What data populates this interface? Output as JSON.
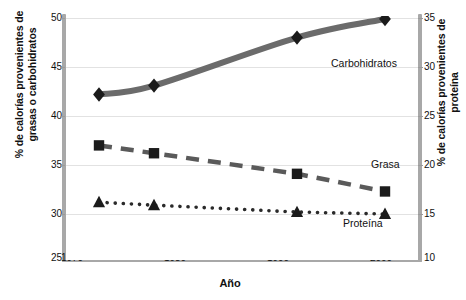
{
  "chart_data": {
    "type": "line",
    "title": "",
    "xlabel": "Año",
    "ylabel_left": "% de calorías provenientes de grasas o carbohidratos",
    "ylabel_right": "% de calorías provenientes de proteína",
    "xlim": [
      1970,
      2002
    ],
    "ylim_left": [
      25,
      50
    ],
    "ylim_right": [
      10,
      35
    ],
    "xticks": [
      1970,
      1980,
      1990,
      2000
    ],
    "yticks_left": [
      25,
      30,
      35,
      40,
      45,
      50
    ],
    "yticks_right": [
      10,
      15,
      20,
      25,
      30,
      35
    ],
    "grid": true,
    "legend": "inline-annotations",
    "x": [
      1973,
      1978,
      1991,
      1999
    ],
    "series": [
      {
        "name": "Carbohidratos",
        "axis": "left",
        "marker": "diamond",
        "line_style": "solid-thick",
        "color": "#6b6b6b",
        "values": [
          42.2,
          43.1,
          48.0,
          49.9
        ]
      },
      {
        "name": "Grasa",
        "axis": "left",
        "marker": "square",
        "line_style": "dashed",
        "color": "#5a5a5a",
        "values": [
          37.0,
          36.2,
          34.1,
          32.3
        ]
      },
      {
        "name": "Proteína",
        "axis": "right",
        "marker": "triangle",
        "line_style": "dotted",
        "color": "#2a2a2a",
        "values_right_axis": [
          16.2,
          15.9,
          15.2,
          15.0
        ],
        "values": [
          31.2,
          30.9,
          30.2,
          30.0
        ]
      }
    ]
  },
  "axes": {
    "x_title": "Año",
    "y_left_title": "% de calorías provenientes de grasas o carbohidratos",
    "y_right_title": "% de calorías provenientes de proteína",
    "x_ticks": [
      "1970",
      "1980",
      "1990",
      "2000"
    ],
    "y_left_ticks": [
      "50",
      "45",
      "40",
      "35",
      "30",
      "25"
    ],
    "y_right_ticks": [
      "35",
      "30",
      "25",
      "20",
      "15",
      "10"
    ]
  },
  "annotations": {
    "carbohidratos": "Carbohidratos",
    "grasa": "Grasa",
    "proteina": "Proteína"
  },
  "colors": {
    "carb_line": "#6b6b6b",
    "fat_line": "#5a5a5a",
    "protein_line": "#2a2a2a",
    "marker": "#1b1b1b",
    "spine": "#a8a8a8",
    "grid": "#e2e2e2",
    "background": "#ffffff"
  }
}
